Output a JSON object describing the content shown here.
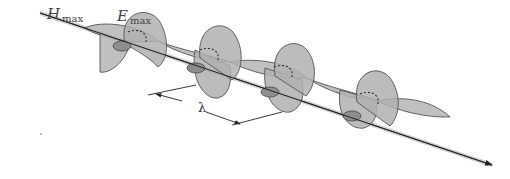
{
  "figure": {
    "labels": {
      "h_max_symbol": "H",
      "h_max_sub": "max",
      "e_max_symbol": "E",
      "e_max_sub": "max",
      "wavelength": "λ"
    },
    "colors": {
      "lobe_fill": "#b8b8b8",
      "lobe_stroke": "#555555",
      "axis": "#333333",
      "background": "#ffffff"
    }
  }
}
